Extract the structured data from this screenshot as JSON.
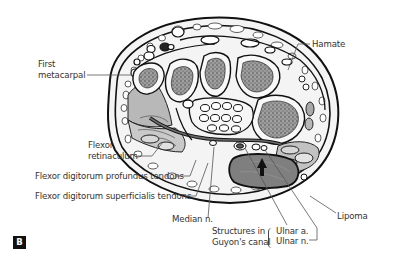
{
  "figure": {
    "panel_label": "B",
    "labels": {
      "first_metacarpal": [
        "First",
        "metacarpal"
      ],
      "hamate": "Hamate",
      "flexor_retinaculum": [
        "Flexor",
        "retinaculum"
      ],
      "fdp_tendons": "Flexor digitorum profundus tendons",
      "fds_tendons": "Flexor digitorum superficialis tendons",
      "median_nerve": "Median n.",
      "guyon_structures": [
        "Structures in",
        "Guyon's canal"
      ],
      "ulnar_artery": "Ulnar a.",
      "ulnar_nerve": "Ulnar n.",
      "lipoma": "Lipoma"
    },
    "colors": {
      "outline": "#1a1a1a",
      "bone_marrow": "#8a8a8a",
      "muscle": "#b5b5b5",
      "lipoma": "#7d7d7d",
      "fat": "#f2f2f2",
      "leader": "#555555"
    }
  }
}
